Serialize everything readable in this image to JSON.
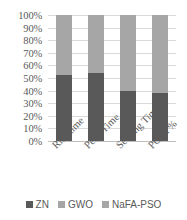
{
  "chart_data": {
    "type": "bar",
    "stacked": true,
    "normalized": true,
    "title": "",
    "xlabel": "",
    "ylabel": "",
    "ylim": [
      0,
      100
    ],
    "ytick_labels": [
      "100%",
      "90%",
      "80%",
      "70%",
      "60%",
      "50%",
      "40%",
      "30%",
      "20%",
      "10%",
      "0%"
    ],
    "ytick_values": [
      100,
      90,
      80,
      70,
      60,
      50,
      40,
      30,
      20,
      10,
      0
    ],
    "grid": "horizontal",
    "legend_position": "bottom",
    "categories": [
      "Rise time",
      "Peak Time",
      "Settling Time",
      "PO in %"
    ],
    "series": [
      {
        "name": "ZN",
        "color": "#595959",
        "values": [
          52,
          54,
          40,
          38
        ]
      },
      {
        "name": "GWO",
        "color": "#a6a6a6",
        "values": [
          24,
          23,
          30,
          31
        ]
      },
      {
        "name": "NaFA-PSO",
        "color": "#a6a6a6",
        "values": [
          24,
          23,
          30,
          31
        ]
      }
    ]
  },
  "legend": {
    "items": [
      {
        "label": "ZN",
        "color": "#595959"
      },
      {
        "label": "GWO",
        "color": "#a6a6a6"
      },
      {
        "label": "NaFA-PSO",
        "color": "#a6a6a6"
      }
    ]
  },
  "colors": {
    "gridline": "#d9d9d9",
    "axis": "#bfbfbf",
    "text": "#5a5a5a",
    "background": "#ffffff"
  }
}
